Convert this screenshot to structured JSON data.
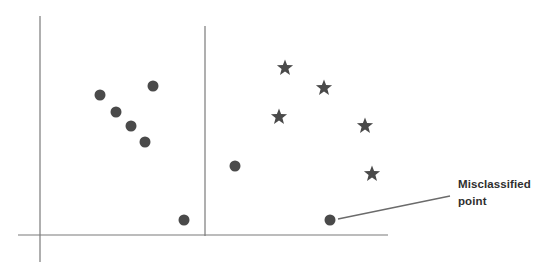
{
  "figure": {
    "title": "",
    "background_color": "#ffffff",
    "width": 550,
    "height": 278
  },
  "annotations": [
    {
      "name": "misclassified-point-callout",
      "line_1": "Misclassified",
      "line_2": "point",
      "text_color": "#2f2f2f",
      "leader_line": {
        "x1": 338,
        "y1": 219,
        "x2": 450,
        "y2": 196
      },
      "points_to": {
        "x": 330,
        "y": 220
      }
    }
  ],
  "axes": {
    "color": "#7a7a7a",
    "x_axis": {
      "name": "x-axis",
      "x1": 18,
      "y1": 235,
      "x2": 388,
      "y2": 235
    },
    "y_axis": {
      "name": "y-axis",
      "x1": 40,
      "y1": 16,
      "x2": 40,
      "y2": 262
    },
    "x_tick_labels": [],
    "y_tick_labels": [],
    "xlabel": "",
    "ylabel": ""
  },
  "decision_boundary": {
    "name": "decision-boundary-line",
    "color": "#7a7a7a",
    "x1": 205,
    "y1": 26,
    "x2": 205,
    "y2": 236
  },
  "chart_data": {
    "type": "scatter",
    "title": "",
    "xlabel": "",
    "ylabel": "",
    "xlim": [
      18,
      388
    ],
    "ylim": [
      16,
      262
    ],
    "grid": false,
    "legend": null,
    "annotations": [
      {
        "text": "Misclassified point",
        "target_x": 330,
        "target_y": 220
      }
    ],
    "reference_lines": [
      {
        "name": "decision-boundary",
        "orientation": "vertical",
        "x": 205,
        "y_start": 26,
        "y_end": 236
      }
    ],
    "series": [
      {
        "name": "Class A",
        "marker": "circle",
        "color": "#4a4a4a",
        "radius": 5.5,
        "points": [
          {
            "x": 100,
            "y": 95
          },
          {
            "x": 116,
            "y": 112
          },
          {
            "x": 131,
            "y": 126
          },
          {
            "x": 145,
            "y": 142
          },
          {
            "x": 153,
            "y": 86
          },
          {
            "x": 184,
            "y": 220
          },
          {
            "x": 235,
            "y": 166
          },
          {
            "x": 330,
            "y": 220
          }
        ]
      },
      {
        "name": "Class B",
        "marker": "star",
        "color": "#4a4a4a",
        "size": 17,
        "points": [
          {
            "x": 285,
            "y": 68
          },
          {
            "x": 324,
            "y": 88
          },
          {
            "x": 279,
            "y": 117
          },
          {
            "x": 365,
            "y": 126
          },
          {
            "x": 372,
            "y": 174
          }
        ]
      }
    ]
  }
}
